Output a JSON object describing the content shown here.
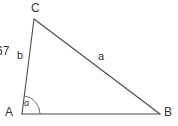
{
  "figure": {
    "kind": "triangle-diagram",
    "background_color": "#ffffff",
    "stroke_color": "#4a4a4a",
    "text_color": "#333333",
    "width": 178,
    "height": 126
  },
  "vertices": {
    "c_label": "C",
    "a_label": "A",
    "b_label": "B"
  },
  "sides": {
    "left_side_label": "b",
    "hypotenuse_label": "a"
  },
  "angles": {
    "alpha_label": "α"
  },
  "clipped_text": {
    "value": "67"
  },
  "geometry": {
    "point_c": {
      "x": 34,
      "y": 19
    },
    "point_a": {
      "x": 22,
      "y": 114
    },
    "point_b": {
      "x": 160,
      "y": 114
    },
    "angle_arc_radius": 18
  }
}
